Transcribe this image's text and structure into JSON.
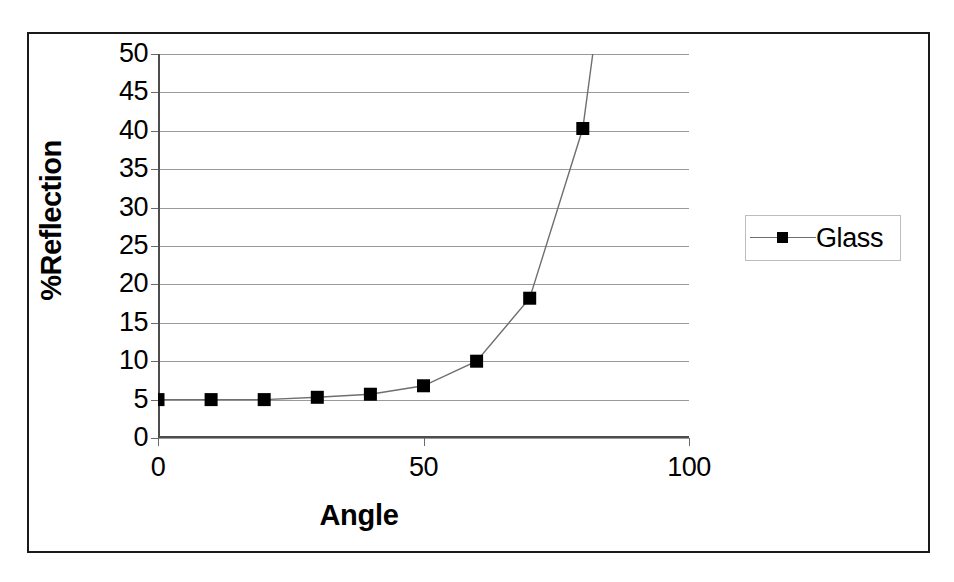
{
  "chart_data": {
    "type": "line",
    "title": "",
    "xlabel": "Angle",
    "ylabel": "%Reflection",
    "xlim": [
      0,
      100
    ],
    "ylim": [
      0,
      50
    ],
    "xticks": [
      0,
      50,
      100
    ],
    "yticks": [
      0,
      5,
      10,
      15,
      20,
      25,
      30,
      35,
      40,
      45,
      50
    ],
    "xtick_labels": [
      "0",
      "50",
      "100"
    ],
    "ytick_labels": [
      "0",
      "5",
      "10",
      "15",
      "20",
      "25",
      "30",
      "35",
      "40",
      "45",
      "50"
    ],
    "grid": "horizontal",
    "legend_position": "right",
    "marker": "square",
    "marker_color": "#000000",
    "line_color": "#6f6f6f",
    "series": [
      {
        "name": "Glass",
        "x": [
          0,
          10,
          20,
          30,
          40,
          50,
          60,
          70,
          80,
          90
        ],
        "values": [
          5.0,
          5.0,
          5.0,
          5.3,
          5.7,
          6.8,
          10.0,
          18.2,
          40.3,
          92.0
        ]
      }
    ]
  },
  "legend": {
    "entries": [
      {
        "label": "Glass"
      }
    ]
  },
  "axes": {
    "x_title": "Angle",
    "y_title": "%Reflection"
  }
}
